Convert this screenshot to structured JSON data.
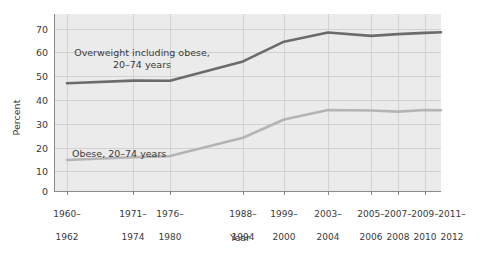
{
  "chart_data": {
    "type": "line",
    "title": "",
    "xlabel": "Year",
    "ylabel": "Percent",
    "ylim": [
      0,
      75
    ],
    "yticks": [
      0,
      10,
      20,
      30,
      40,
      50,
      60,
      70
    ],
    "grid": true,
    "legend_position": "inline-annotations",
    "categories": [
      "1960–\n1962",
      "1971–\n1974",
      "1976–\n1980",
      "1988–\n1994",
      "1999–\n2000",
      "2003–\n2004",
      "2005–\n2006",
      "2007–\n2008",
      "2009–\n2010",
      "2011–\n2012"
    ],
    "series": [
      {
        "name": "Overweight including obese, 20–74 years",
        "color": "#6b6b6b",
        "values": [
          46.6,
          47.7,
          47.6,
          56.0,
          64.5,
          68.5,
          67.0,
          67.8,
          68.3,
          68.6
        ]
      },
      {
        "name": "Obese, 20–74 years",
        "color": "#b4b4b4",
        "values": [
          13.4,
          14.6,
          15.1,
          23.0,
          30.9,
          35.0,
          34.8,
          34.3,
          35.0,
          34.9
        ]
      }
    ],
    "annotations": [
      {
        "text": "Overweight including obese,\n20–74 years",
        "series": "overweight"
      },
      {
        "text": "Obese, 20–74 years",
        "series": "obese"
      }
    ]
  },
  "axes": {
    "y_label": "Percent",
    "x_label": "Year",
    "y_ticks": [
      "0",
      "10",
      "20",
      "30",
      "40",
      "50",
      "60",
      "70"
    ],
    "x_ticks": [
      {
        "top": "1960–",
        "bottom": "1962"
      },
      {
        "top": "1971–",
        "bottom": "1974"
      },
      {
        "top": "1976–",
        "bottom": "1980"
      },
      {
        "top": "1988–",
        "bottom": "1994"
      },
      {
        "top": "1999–",
        "bottom": "2000"
      },
      {
        "top": "2003–",
        "bottom": "2004"
      },
      {
        "top": "2005–",
        "bottom": "2006"
      },
      {
        "top": "2007–",
        "bottom": "2008"
      },
      {
        "top": "2009–",
        "bottom": "2010"
      },
      {
        "top": "2011–",
        "bottom": "2012"
      }
    ]
  },
  "annotations": {
    "overweight": "Overweight including obese,\n20–74 years",
    "obese": "Obese, 20–74 years"
  },
  "colors": {
    "panel_background": "#ebebeb",
    "gridline": "#d2d2d2",
    "axis": "#8a8a8a",
    "series_overweight": "#6b6b6b",
    "series_obese": "#b4b4b4",
    "text": "#3a3a3a"
  }
}
